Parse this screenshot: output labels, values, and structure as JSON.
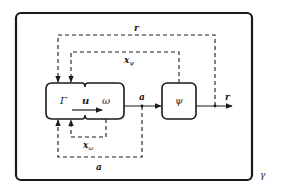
{
  "diagram": {
    "outer_box_label": "γ",
    "left_block": {
      "left_label": "Γ",
      "middle_label": "u",
      "right_label": "ω"
    },
    "right_block": {
      "label": "ψ"
    },
    "signals": {
      "a_main": "a",
      "r_main": "r",
      "r_feedback": "r",
      "x_psi": "x",
      "x_psi_sub": "ψ",
      "x_omega": "x",
      "x_omega_sub": "ω",
      "a_feedback": "a"
    },
    "colors": {
      "stroke": "#1a1a1a",
      "background": "#ffffff"
    }
  }
}
